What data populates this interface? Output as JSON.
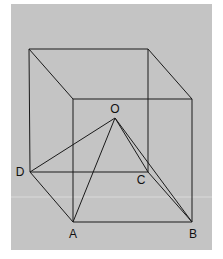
{
  "diagram": {
    "type": "cube-with-pyramid",
    "background_color": "#c4c4c4",
    "line_color": "#1a1a1a",
    "points": {
      "O": {
        "label": "O",
        "x": 115,
        "y": 118,
        "label_x": 115,
        "label_y": 113
      },
      "A": {
        "label": "A",
        "x": 73,
        "y": 222,
        "label_x": 73,
        "label_y": 238
      },
      "B": {
        "label": "B",
        "x": 192,
        "y": 222,
        "label_x": 193,
        "label_y": 238
      },
      "C": {
        "label": "C",
        "x": 148,
        "y": 172,
        "label_x": 141,
        "label_y": 184
      },
      "D": {
        "label": "D",
        "x": 30,
        "y": 172,
        "label_x": 20,
        "label_y": 176
      }
    },
    "cube_corners": {
      "back_top_left": [
        29,
        49
      ],
      "back_top_right": [
        148,
        49
      ],
      "front_top_left": [
        73,
        99
      ],
      "front_top_right": [
        192,
        99
      ]
    }
  }
}
